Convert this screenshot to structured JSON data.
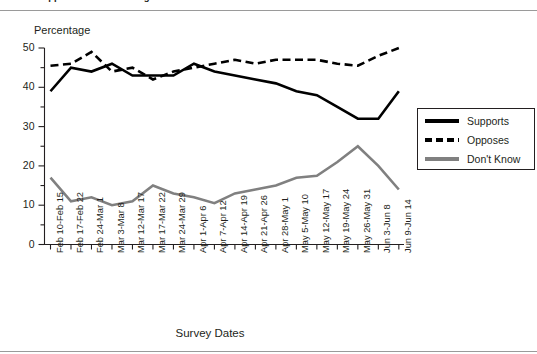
{
  "figure": {
    "title_partial": "Public Support for Abortion Rights Remains Stable"
  },
  "chart_data": {
    "type": "line",
    "title": "",
    "xlabel": "Survey Dates",
    "ylabel": "Percentage",
    "ylim": [
      0,
      50
    ],
    "y_major_ticks": [
      0,
      10,
      20,
      30,
      40,
      50
    ],
    "y_minor_tick_step": 5,
    "grid": false,
    "legend_position": "right",
    "categories": [
      "Feb 10-Feb 15",
      "Feb 17-Feb 22",
      "Feb 24-Mar 1",
      "Mar 3-Mar 8",
      "Mar 12-Mar 17",
      "Mar 17-Mar 22",
      "Mar 24-Mar 29",
      "Apr 1-Apr 6",
      "Apr 7-Apr 12",
      "Apr 14-Apr 19",
      "Apr 21-Apr 26",
      "Apr 28-May 1",
      "May 5-May 10",
      "May 12-May 17",
      "May 19-May 24",
      "May 26-May 31",
      "Jun 3-Jun 8",
      "Jun 9-Jun 14"
    ],
    "series": [
      {
        "name": "Supports",
        "color": "#000000",
        "style": "solid",
        "values": [
          39,
          45,
          44,
          46,
          43,
          43,
          43,
          46,
          44,
          43,
          42,
          41,
          39,
          38,
          35,
          32,
          32,
          39
        ]
      },
      {
        "name": "Opposes",
        "color": "#000000",
        "style": "dashed",
        "values": [
          45.5,
          46,
          49,
          44,
          45,
          42,
          44,
          45,
          46,
          47,
          46,
          47,
          47,
          47,
          46,
          45.5,
          48,
          50
        ]
      },
      {
        "name": "Don't Know",
        "color": "#808080",
        "style": "solid",
        "values": [
          17,
          11,
          12,
          10,
          11,
          15,
          13,
          12,
          10.5,
          13,
          14,
          15,
          17,
          17.5,
          21,
          25,
          20,
          14
        ]
      }
    ]
  },
  "legend": {
    "items": [
      {
        "label": "Supports",
        "swatch": "solid-black"
      },
      {
        "label": "Opposes",
        "swatch": "dashed-black"
      },
      {
        "label": "Don't Know",
        "swatch": "solid-gray"
      }
    ]
  }
}
